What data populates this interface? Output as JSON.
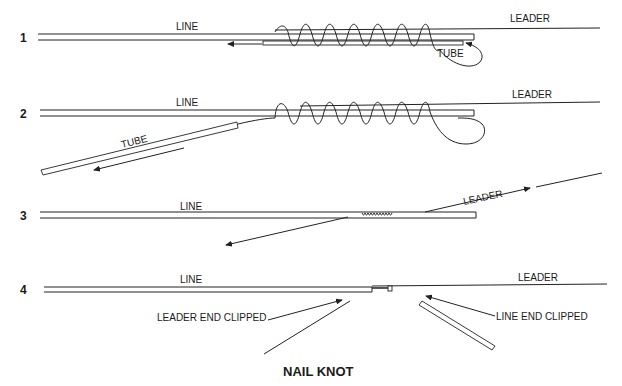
{
  "title": "NAIL KNOT",
  "colors": {
    "ink": "#222222",
    "background": "#ffffff"
  },
  "steps": [
    {
      "number": "1",
      "labels": {
        "line": "LINE",
        "leader": "LEADER",
        "tube": "TUBE"
      }
    },
    {
      "number": "2",
      "labels": {
        "line": "LINE",
        "leader": "LEADER",
        "tube": "TUBE"
      }
    },
    {
      "number": "3",
      "labels": {
        "line": "LINE",
        "leader": "LEADER"
      }
    },
    {
      "number": "4",
      "labels": {
        "line": "LINE",
        "leader": "LEADER",
        "leader_end_clipped": "LEADER END CLIPPED",
        "line_end_clipped": "LINE END CLIPPED"
      }
    }
  ]
}
